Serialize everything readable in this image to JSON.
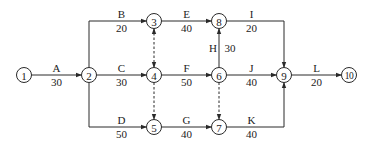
{
  "diagram": {
    "type": "activity-on-arrow network",
    "nodes": [
      {
        "id": "1",
        "label": "1"
      },
      {
        "id": "2",
        "label": "2"
      },
      {
        "id": "3",
        "label": "3"
      },
      {
        "id": "4",
        "label": "4"
      },
      {
        "id": "5",
        "label": "5"
      },
      {
        "id": "6",
        "label": "6"
      },
      {
        "id": "7",
        "label": "7"
      },
      {
        "id": "8",
        "label": "8"
      },
      {
        "id": "9",
        "label": "9"
      },
      {
        "id": "10",
        "label": "10"
      }
    ],
    "activities": [
      {
        "from": "1",
        "to": "2",
        "name": "A",
        "duration": "30"
      },
      {
        "from": "2",
        "to": "3",
        "name": "B",
        "duration": "20"
      },
      {
        "from": "2",
        "to": "4",
        "name": "C",
        "duration": "30"
      },
      {
        "from": "2",
        "to": "5",
        "name": "D",
        "duration": "50"
      },
      {
        "from": "3",
        "to": "8",
        "name": "E",
        "duration": "40"
      },
      {
        "from": "4",
        "to": "6",
        "name": "F",
        "duration": "50"
      },
      {
        "from": "5",
        "to": "7",
        "name": "G",
        "duration": "40"
      },
      {
        "from": "6",
        "to": "8",
        "name": "H",
        "duration": "30"
      },
      {
        "from": "8",
        "to": "9",
        "name": "I",
        "duration": "20"
      },
      {
        "from": "6",
        "to": "9",
        "name": "J",
        "duration": "40"
      },
      {
        "from": "7",
        "to": "9",
        "name": "K",
        "duration": "40"
      },
      {
        "from": "9",
        "to": "10",
        "name": "L",
        "duration": "20"
      }
    ],
    "dummies": [
      {
        "from": "3",
        "to": "4"
      },
      {
        "from": "4",
        "to": "5"
      },
      {
        "from": "6",
        "to": "7"
      }
    ]
  }
}
